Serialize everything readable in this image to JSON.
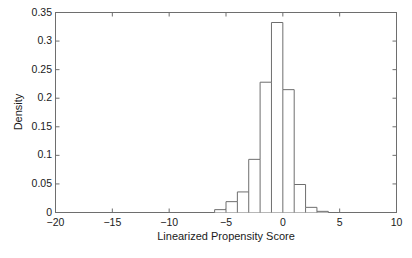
{
  "chart_data": {
    "type": "bar",
    "title": "",
    "subtitle": "",
    "xlabel": "Linearized Propensity Score",
    "ylabel": "Density",
    "xlim": [
      -20,
      10
    ],
    "ylim": [
      0,
      0.35
    ],
    "grid": false,
    "legend": null,
    "xticks": [
      "-20",
      "-15",
      "-10",
      "-5",
      "0",
      "5",
      "10"
    ],
    "xtick_values": [
      -20,
      -15,
      -10,
      -5,
      0,
      5,
      10
    ],
    "yticks": [
      "0",
      "0.05",
      "0.1",
      "0.15",
      "0.2",
      "0.25",
      "0.3",
      "0.35"
    ],
    "ytick_values": [
      0,
      0.05,
      0.1,
      0.15,
      0.2,
      0.25,
      0.3,
      0.35
    ],
    "bin_width": 1,
    "bin_edges": [
      -6,
      -5,
      -4,
      -3,
      -2,
      -1,
      0,
      1,
      2,
      3,
      4
    ],
    "categories": [
      "-6 to -5",
      "-5 to -4",
      "-4 to -3",
      "-3 to -2",
      "-2 to -1",
      "-1 to 0",
      "0 to 1",
      "1 to 2",
      "2 to 3",
      "3 to 4"
    ],
    "values": [
      0.005,
      0.019,
      0.036,
      0.093,
      0.228,
      0.3325,
      0.215,
      0.049,
      0.009,
      0.002
    ],
    "bar_fill": "#ffffff",
    "bar_stroke": "#6e6e6e",
    "axis_color": "#6e6e6e",
    "text_color": "#1a1a1a"
  }
}
